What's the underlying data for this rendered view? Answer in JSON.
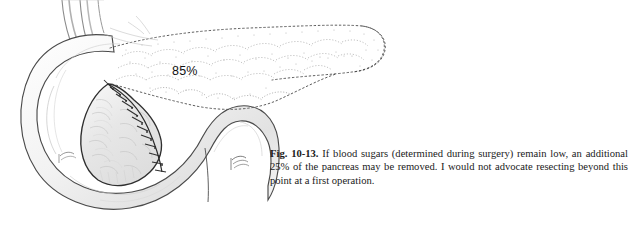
{
  "page": {
    "background_color": "#ffffff",
    "width": 638,
    "height": 233
  },
  "figure": {
    "label": "Fig. 10-13.",
    "percent_label": "85%",
    "caption_text": " If blood sugars (determined during surgery) remain low, an additional 25% of the pancreas may be removed. I would not advocate resecting beyond this point at a first operation.",
    "ink_color": "#1a1a1a",
    "illustration_name": "85-percent-distal-pancreatectomy-drawing",
    "anatomy": {
      "duodenum": "duodenal-c-loop",
      "pancreas_remnant": "pancreatic-head-remnant",
      "suture_line": "transection-suture-line",
      "resected_outline": "dotted-resected-pancreas-body-and-tail",
      "vessels": "superior-vessel-stumps"
    }
  }
}
